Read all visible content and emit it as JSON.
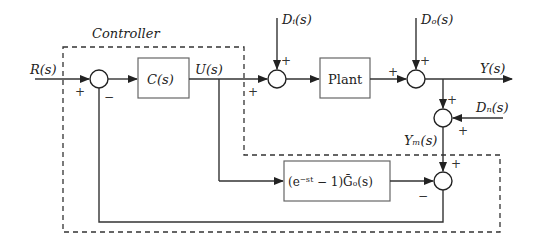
{
  "diagram": {
    "type": "block-diagram",
    "controller_label": "Controller",
    "signals": {
      "reference": "R(s)",
      "control": "U(s)",
      "input_disturbance": "Dᵢ(s)",
      "output_disturbance": "Dₒ(s)",
      "output": "Y(s)",
      "noise": "Dₙ(s)",
      "measured": "Yₘ(s)"
    },
    "blocks": {
      "controller": "C(s)",
      "plant": "Plant",
      "predictor": "(e⁻ˢᵗ − 1)Ḡₒ(s)"
    },
    "signs": {
      "sum1_ref": "+",
      "sum1_fb": "−",
      "sum2_u": "+",
      "sum2_di": "+",
      "sum3_plant": "+",
      "sum3_do": "+",
      "sum4_y": "+",
      "sum4_dn": "+",
      "sum5_ym": "+",
      "sum5_pred": "−"
    }
  }
}
